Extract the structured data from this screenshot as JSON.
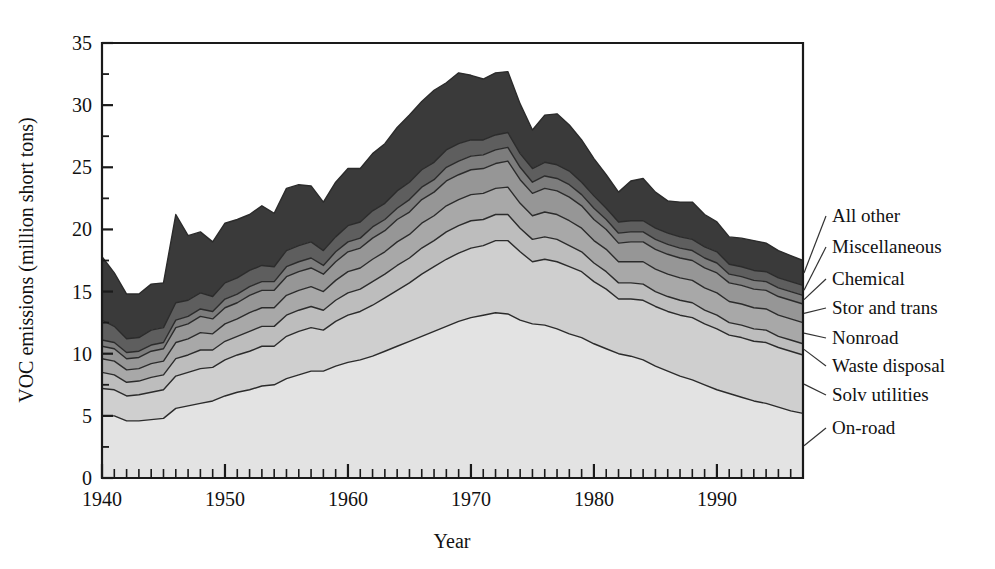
{
  "chart_data": {
    "type": "area",
    "stacked": true,
    "title": "",
    "xlabel": "Year",
    "ylabel": "VOC emissions (million short tons)",
    "xlim": [
      1940,
      1997
    ],
    "ylim": [
      0,
      35
    ],
    "ytick_values": [
      0,
      5,
      10,
      15,
      20,
      25,
      30,
      35
    ],
    "ytick_labels": [
      "0",
      "5",
      "10",
      "15",
      "20",
      "25",
      "30",
      "35"
    ],
    "yminor_step": 2.5,
    "xtick_values": [
      1940,
      1950,
      1960,
      1970,
      1980,
      1990
    ],
    "xtick_labels": [
      "1940",
      "1950",
      "1960",
      "1970",
      "1980",
      "1990"
    ],
    "xminor_step": 1,
    "grid": false,
    "legend_position": "right-outside-leader-lines",
    "x": [
      1940,
      1941,
      1942,
      1943,
      1944,
      1945,
      1946,
      1947,
      1948,
      1949,
      1950,
      1951,
      1952,
      1953,
      1954,
      1955,
      1956,
      1957,
      1958,
      1959,
      1960,
      1961,
      1962,
      1963,
      1964,
      1965,
      1966,
      1967,
      1968,
      1969,
      1970,
      1971,
      1972,
      1973,
      1974,
      1975,
      1976,
      1977,
      1978,
      1979,
      1980,
      1981,
      1982,
      1983,
      1984,
      1985,
      1986,
      1987,
      1988,
      1989,
      1990,
      1991,
      1992,
      1993,
      1994,
      1995,
      1996,
      1997
    ],
    "series": [
      {
        "name": "On-road",
        "color": "#e3e3e3",
        "values": [
          5.0,
          5.0,
          4.6,
          4.6,
          4.7,
          4.8,
          5.6,
          5.8,
          6.0,
          6.2,
          6.6,
          6.9,
          7.1,
          7.4,
          7.5,
          8.0,
          8.3,
          8.6,
          8.6,
          9.0,
          9.3,
          9.5,
          9.8,
          10.2,
          10.6,
          11.0,
          11.4,
          11.8,
          12.2,
          12.6,
          12.9,
          13.1,
          13.3,
          13.2,
          12.7,
          12.4,
          12.3,
          12.0,
          11.6,
          11.3,
          10.8,
          10.4,
          10.0,
          9.8,
          9.5,
          9.0,
          8.6,
          8.2,
          7.9,
          7.5,
          7.1,
          6.8,
          6.5,
          6.2,
          6.0,
          5.7,
          5.4,
          5.2
        ]
      },
      {
        "name": "Solv utilities",
        "color": "#cfcfcf",
        "values": [
          2.2,
          2.1,
          2.0,
          2.1,
          2.2,
          2.3,
          2.6,
          2.7,
          2.8,
          2.7,
          2.9,
          3.0,
          3.1,
          3.2,
          3.1,
          3.4,
          3.5,
          3.5,
          3.3,
          3.6,
          3.8,
          3.9,
          4.1,
          4.3,
          4.5,
          4.7,
          5.0,
          5.2,
          5.4,
          5.5,
          5.6,
          5.6,
          5.8,
          5.9,
          5.5,
          5.0,
          5.3,
          5.4,
          5.4,
          5.3,
          5.0,
          4.8,
          4.4,
          4.6,
          4.8,
          4.8,
          4.8,
          4.9,
          5.0,
          4.9,
          4.9,
          4.7,
          4.8,
          4.8,
          4.9,
          4.8,
          4.8,
          4.7
        ]
      },
      {
        "name": "Waste disposal",
        "color": "#bdbdbd",
        "values": [
          1.3,
          1.2,
          1.1,
          1.1,
          1.2,
          1.2,
          1.4,
          1.4,
          1.5,
          1.4,
          1.5,
          1.5,
          1.6,
          1.6,
          1.6,
          1.7,
          1.7,
          1.7,
          1.6,
          1.7,
          1.8,
          1.8,
          1.9,
          1.9,
          2.0,
          2.0,
          2.1,
          2.1,
          2.2,
          2.2,
          2.2,
          2.1,
          2.1,
          2.1,
          1.9,
          1.8,
          1.8,
          1.8,
          1.7,
          1.6,
          1.5,
          1.4,
          1.3,
          1.3,
          1.3,
          1.2,
          1.2,
          1.2,
          1.2,
          1.1,
          1.1,
          1.0,
          1.0,
          1.0,
          1.0,
          0.9,
          0.9,
          0.9
        ]
      },
      {
        "name": "Nonroad",
        "color": "#a8a8a8",
        "values": [
          1.1,
          1.1,
          1.0,
          1.0,
          1.1,
          1.1,
          1.3,
          1.3,
          1.4,
          1.3,
          1.4,
          1.4,
          1.5,
          1.5,
          1.5,
          1.6,
          1.6,
          1.6,
          1.5,
          1.6,
          1.7,
          1.7,
          1.8,
          1.8,
          1.9,
          1.9,
          2.0,
          2.0,
          2.1,
          2.1,
          2.1,
          2.1,
          2.1,
          2.2,
          2.0,
          1.9,
          2.0,
          2.0,
          2.0,
          1.9,
          1.8,
          1.8,
          1.7,
          1.7,
          1.8,
          1.8,
          1.8,
          1.8,
          1.8,
          1.8,
          1.8,
          1.7,
          1.7,
          1.7,
          1.7,
          1.7,
          1.7,
          1.7
        ]
      },
      {
        "name": "Stor and trans",
        "color": "#969696",
        "values": [
          1.0,
          1.0,
          0.9,
          0.9,
          1.0,
          1.0,
          1.2,
          1.2,
          1.3,
          1.2,
          1.3,
          1.3,
          1.4,
          1.4,
          1.4,
          1.5,
          1.5,
          1.5,
          1.4,
          1.5,
          1.6,
          1.6,
          1.7,
          1.7,
          1.8,
          1.8,
          1.9,
          1.9,
          2.0,
          2.0,
          2.0,
          2.0,
          2.0,
          2.1,
          1.9,
          1.8,
          1.9,
          1.9,
          1.9,
          1.8,
          1.7,
          1.6,
          1.5,
          1.6,
          1.6,
          1.6,
          1.6,
          1.6,
          1.6,
          1.6,
          1.6,
          1.5,
          1.5,
          1.5,
          1.5,
          1.5,
          1.5,
          1.5
        ]
      },
      {
        "name": "Chemical",
        "color": "#7d7d7d",
        "values": [
          0.5,
          0.5,
          0.5,
          0.5,
          0.5,
          0.5,
          0.6,
          0.6,
          0.6,
          0.6,
          0.7,
          0.7,
          0.7,
          0.7,
          0.7,
          0.8,
          0.8,
          0.8,
          0.7,
          0.8,
          0.8,
          0.8,
          0.9,
          0.9,
          0.9,
          1.0,
          1.0,
          1.0,
          1.1,
          1.1,
          1.1,
          1.1,
          1.1,
          1.1,
          1.0,
          0.9,
          1.0,
          1.0,
          1.0,
          0.9,
          0.9,
          0.8,
          0.8,
          0.8,
          0.8,
          0.8,
          0.8,
          0.8,
          0.8,
          0.8,
          0.8,
          0.7,
          0.7,
          0.7,
          0.7,
          0.7,
          0.7,
          0.7
        ]
      },
      {
        "name": "Miscellaneous",
        "color": "#5e5e5e",
        "values": [
          1.6,
          1.3,
          1.1,
          1.1,
          1.2,
          1.2,
          1.4,
          1.3,
          1.3,
          1.2,
          1.3,
          1.3,
          1.3,
          1.3,
          1.2,
          1.3,
          1.3,
          1.3,
          1.2,
          1.2,
          1.3,
          1.3,
          1.3,
          1.3,
          1.4,
          1.4,
          1.4,
          1.4,
          1.4,
          1.4,
          1.3,
          1.2,
          1.2,
          1.2,
          1.1,
          1.1,
          1.1,
          1.1,
          1.1,
          1.0,
          1.0,
          0.9,
          0.9,
          0.9,
          0.9,
          0.9,
          0.9,
          0.9,
          0.9,
          0.9,
          0.9,
          0.8,
          0.8,
          0.8,
          0.8,
          0.8,
          0.8,
          0.8
        ]
      },
      {
        "name": "All other",
        "color": "#3a3a3a",
        "values": [
          5.1,
          4.3,
          3.6,
          3.5,
          3.7,
          3.6,
          7.1,
          5.2,
          4.9,
          4.4,
          4.8,
          4.7,
          4.5,
          4.8,
          4.3,
          5.0,
          4.9,
          4.5,
          3.9,
          4.4,
          4.6,
          4.3,
          4.6,
          4.8,
          5.1,
          5.4,
          5.5,
          5.8,
          5.4,
          5.7,
          5.2,
          4.9,
          5.0,
          4.9,
          4.0,
          3.1,
          3.8,
          4.1,
          3.7,
          3.4,
          3.0,
          2.7,
          2.4,
          3.2,
          3.4,
          2.9,
          2.6,
          2.8,
          3.0,
          2.6,
          2.4,
          2.2,
          2.3,
          2.4,
          2.3,
          2.2,
          2.1,
          2.0
        ]
      }
    ],
    "totals_note": "Stacked totals peak near 31 around 1967-1970 and decline to about 19 by 1997"
  },
  "axes": {
    "y_label": "VOC emissions (million short tons)",
    "x_label": "Year",
    "y_ticks": [
      "0",
      "5",
      "10",
      "15",
      "20",
      "25",
      "30",
      "35"
    ],
    "x_ticks": [
      "1940",
      "1950",
      "1960",
      "1970",
      "1980",
      "1990"
    ]
  },
  "legend": {
    "entries": [
      {
        "label": "All other"
      },
      {
        "label": "Miscellaneous"
      },
      {
        "label": "Chemical"
      },
      {
        "label": "Stor and trans"
      },
      {
        "label": "Nonroad"
      },
      {
        "label": "Waste disposal"
      },
      {
        "label": "Solv utilities"
      },
      {
        "label": "On-road"
      }
    ]
  }
}
